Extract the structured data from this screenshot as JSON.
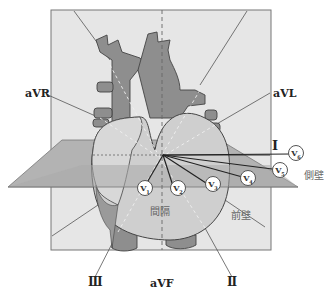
{
  "diagram": {
    "title": "",
    "limb_leads": {
      "aVR": "aVR",
      "aVL": "aVL",
      "I": "Ⅰ",
      "II": "Ⅱ",
      "III": "Ⅲ",
      "aVF": "aVF"
    },
    "chest_leads": [
      {
        "id": "V1",
        "letter": "V",
        "num": "1"
      },
      {
        "id": "V2",
        "letter": "V",
        "num": "2"
      },
      {
        "id": "V3",
        "letter": "V",
        "num": "3"
      },
      {
        "id": "V4",
        "letter": "V",
        "num": "4"
      },
      {
        "id": "V5",
        "letter": "V",
        "num": "5"
      },
      {
        "id": "V6",
        "letter": "V",
        "num": "6"
      }
    ],
    "regions": {
      "septum": "間隔",
      "anterior_wall": "前壁",
      "lateral_wall": "側壁"
    },
    "colors": {
      "frontal_plane": "#e4e4e4",
      "horizontal_plane": "#a9a9a9",
      "heart_light": "#cfcfcf",
      "heart_dark": "#8f8f8f",
      "outline": "#555555"
    }
  }
}
